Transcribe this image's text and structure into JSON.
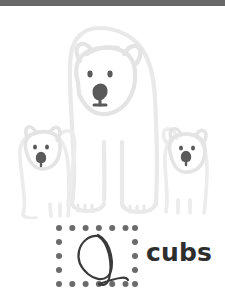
{
  "page": {
    "background_color": "#ffffff",
    "width": 225,
    "height": 305
  },
  "header": {
    "bar_color": "#696969"
  },
  "illustration": {
    "name": "polar-bear-family",
    "outline_color": "#e8e8e8",
    "outline_color_soft": "#ededed",
    "feature_color": "#5a5a5a",
    "subjects": [
      {
        "name": "adult-polar-bear",
        "position": "center"
      },
      {
        "name": "polar-bear-cub-left",
        "position": "left"
      },
      {
        "name": "polar-bear-cub-right",
        "position": "right"
      }
    ]
  },
  "tracing": {
    "box_name": "dotted-tracing-box",
    "dot_color": "#6b6b6b",
    "dots_top": 7,
    "dots_bottom": 7,
    "dots_left": 5,
    "dots_right": 5,
    "letter": "Q",
    "letter_color": "#3a3a3a",
    "letter_style": "handwritten-cursive"
  },
  "word": {
    "label": "cubs",
    "color": "#2e2e2e"
  }
}
